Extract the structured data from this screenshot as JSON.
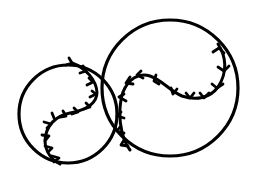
{
  "illustration": {
    "subject": "two baseballs line drawing",
    "colors": {
      "background": "#ffffff",
      "line": "#000000"
    },
    "balls": [
      {
        "name": "small-baseball",
        "cx": 68,
        "cy": 114,
        "r": 49,
        "seam": "M72,63 C86,68 96,80 97,92 C97,104 86,110 70,113 C55,116 46,126 45,140 C45,152 52,160 60,164",
        "stitches": [
          [
            [
              66,
              65
            ],
            [
              72,
              63
            ],
            [
              69,
              58
            ]
          ],
          [
            [
              83,
              66
            ],
            [
              86,
              71
            ],
            [
              80,
              73
            ]
          ],
          [
            [
              89,
              78
            ],
            [
              93,
              82
            ],
            [
              87,
              85
            ]
          ],
          [
            [
              92,
              91
            ],
            [
              96,
              94
            ],
            [
              90,
              97
            ]
          ],
          [
            [
              86,
              103
            ],
            [
              90,
              107
            ],
            [
              84,
              109
            ]
          ],
          [
            [
              74,
              108
            ],
            [
              78,
              112
            ],
            [
              72,
              114
            ]
          ],
          [
            [
              63,
              111
            ],
            [
              66,
              116
            ],
            [
              60,
              117
            ]
          ],
          [
            [
              54,
              118
            ],
            [
              52,
              113
            ]
          ],
          [
            [
              47,
              128
            ],
            [
              51,
              124
            ],
            [
              44,
              122
            ]
          ],
          [
            [
              45,
              141
            ],
            [
              49,
              136
            ],
            [
              42,
              135
            ]
          ],
          [
            [
              48,
              152
            ],
            [
              52,
              148
            ],
            [
              45,
              146
            ]
          ],
          [
            [
              54,
              162
            ],
            [
              59,
              158
            ],
            [
              52,
              156
            ]
          ]
        ]
      },
      {
        "name": "large-baseball",
        "cx": 170,
        "cy": 88,
        "r": 68,
        "seam": "M218,44 C226,56 228,72 218,87 C210,98 196,101 182,96 C170,91 162,80 150,76 C138,72 128,80 123,92 C119,104 119,120 122,132 C124,140 127,146 130,150",
        "stitches": [
          [
            [
              213,
              52
            ],
            [
              219,
              48
            ],
            [
              224,
              53
            ]
          ],
          [
            [
              218,
              67
            ],
            [
              224,
              71
            ],
            [
              229,
              66
            ]
          ],
          [
            [
              212,
              84
            ],
            [
              217,
              88
            ],
            [
              223,
              84
            ]
          ],
          [
            [
              200,
              93
            ],
            [
              204,
              98
            ],
            [
              209,
              93
            ]
          ],
          [
            [
              186,
              93
            ],
            [
              190,
              98
            ],
            [
              194,
              93
            ]
          ],
          [
            [
              171,
              88
            ],
            [
              173,
              94
            ],
            [
              177,
              89
            ]
          ],
          [
            [
              156,
              75
            ],
            [
              154,
              81
            ],
            [
              159,
              84
            ]
          ],
          [
            [
              141,
              71
            ],
            [
              137,
              75
            ],
            [
              143,
              78
            ]
          ],
          [
            [
              130,
              77
            ],
            [
              126,
              83
            ],
            [
              133,
              84
            ]
          ],
          [
            [
              124,
              94
            ],
            [
              119,
              97
            ],
            [
              126,
              101
            ]
          ],
          [
            [
              121,
              112
            ],
            [
              117,
              116
            ],
            [
              124,
              118
            ]
          ],
          [
            [
              120,
              127
            ],
            [
              117,
              131
            ],
            [
              124,
              133
            ]
          ],
          [
            [
              124,
              140
            ],
            [
              121,
              145
            ],
            [
              128,
              146
            ]
          ]
        ]
      }
    ]
  }
}
